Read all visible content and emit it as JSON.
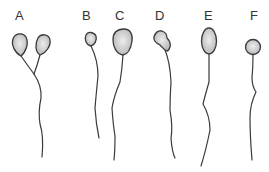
{
  "figure": {
    "title": "",
    "colors": {
      "head_fill_center": "#e6e6e6",
      "head_fill_edge": "#b8b8b8",
      "outline": "#3a3a3a",
      "label": "#333333",
      "background": "#ffffff"
    },
    "panels": [
      {
        "label": "A",
        "form": "two heads, forked tail joining into single tail"
      },
      {
        "label": "B",
        "form": "small head, single tail"
      },
      {
        "label": "C",
        "form": "large head, single tail"
      },
      {
        "label": "D",
        "form": "amorphous head, single tail"
      },
      {
        "label": "E",
        "form": "tapered/elongated oval head, single tail"
      },
      {
        "label": "F",
        "form": "round head, single tail"
      }
    ]
  }
}
